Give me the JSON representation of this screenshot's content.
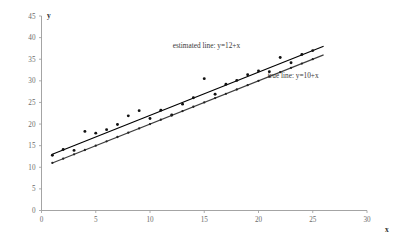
{
  "chart_data": {
    "type": "scatter",
    "title": "",
    "xlabel": "x",
    "ylabel": "y",
    "xlim": [
      0,
      30
    ],
    "ylim": [
      0,
      45
    ],
    "xticks": [
      0,
      5,
      10,
      15,
      20,
      25,
      30
    ],
    "yticks": [
      0,
      5,
      10,
      15,
      20,
      25,
      30,
      35,
      40,
      45
    ],
    "grid": false,
    "legend_position": "inline-annotations",
    "annotations": [
      {
        "name": "estimated-line-label",
        "text": "estimated line: y=12+x",
        "x": 15.2,
        "y": 37.6
      },
      {
        "name": "true-line-label",
        "text": "true line: y=10+x",
        "x": 23.2,
        "y": 30.6
      }
    ],
    "series": [
      {
        "name": "observed data",
        "type": "scatter",
        "marker": "filled-circle",
        "color": "#111111",
        "points": [
          {
            "x": 1,
            "y": 12.8
          },
          {
            "x": 2,
            "y": 14.1
          },
          {
            "x": 3,
            "y": 13.9
          },
          {
            "x": 4,
            "y": 18.3
          },
          {
            "x": 5,
            "y": 17.9
          },
          {
            "x": 6,
            "y": 18.7
          },
          {
            "x": 7,
            "y": 19.9
          },
          {
            "x": 8,
            "y": 21.9
          },
          {
            "x": 9,
            "y": 23.1
          },
          {
            "x": 10,
            "y": 21.3
          },
          {
            "x": 11,
            "y": 23.2
          },
          {
            "x": 12,
            "y": 22.1
          },
          {
            "x": 13,
            "y": 24.6
          },
          {
            "x": 14,
            "y": 26.1
          },
          {
            "x": 15,
            "y": 30.5
          },
          {
            "x": 16,
            "y": 26.9
          },
          {
            "x": 17,
            "y": 29.2
          },
          {
            "x": 18,
            "y": 30.1
          },
          {
            "x": 19,
            "y": 31.4
          },
          {
            "x": 20,
            "y": 32.3
          },
          {
            "x": 21,
            "y": 32.1
          },
          {
            "x": 22,
            "y": 35.4
          },
          {
            "x": 23,
            "y": 34.2
          },
          {
            "x": 24,
            "y": 36.1
          },
          {
            "x": 25,
            "y": 37.0
          }
        ]
      },
      {
        "name": "true line points",
        "type": "scatter",
        "marker": "small-filled-circle",
        "color": "#222222",
        "points": [
          {
            "x": 1,
            "y": 11.0
          },
          {
            "x": 2,
            "y": 12.0
          },
          {
            "x": 3,
            "y": 13.0
          },
          {
            "x": 4,
            "y": 14.0
          },
          {
            "x": 5,
            "y": 15.0
          },
          {
            "x": 6,
            "y": 16.0
          },
          {
            "x": 7,
            "y": 17.0
          },
          {
            "x": 8,
            "y": 18.0
          },
          {
            "x": 9,
            "y": 19.0
          },
          {
            "x": 10,
            "y": 20.0
          },
          {
            "x": 11,
            "y": 21.0
          },
          {
            "x": 12,
            "y": 22.0
          },
          {
            "x": 13,
            "y": 23.0
          },
          {
            "x": 14,
            "y": 24.0
          },
          {
            "x": 15,
            "y": 25.0
          },
          {
            "x": 16,
            "y": 26.0
          },
          {
            "x": 17,
            "y": 27.0
          },
          {
            "x": 18,
            "y": 28.0
          },
          {
            "x": 19,
            "y": 29.0
          },
          {
            "x": 20,
            "y": 30.0
          },
          {
            "x": 21,
            "y": 31.0
          },
          {
            "x": 22,
            "y": 32.0
          },
          {
            "x": 23,
            "y": 33.0
          },
          {
            "x": 24,
            "y": 34.0
          },
          {
            "x": 25,
            "y": 35.0
          }
        ]
      },
      {
        "name": "estimated line: y=12+x",
        "type": "line",
        "equation": "y=12+x",
        "intercept": 12,
        "slope": 1,
        "color": "#000000",
        "x_start": 1,
        "x_end": 26
      },
      {
        "name": "true line: y=10+x",
        "type": "line",
        "equation": "y=10+x",
        "intercept": 10,
        "slope": 1,
        "color": "#3d3d3d",
        "x_start": 1,
        "x_end": 26
      }
    ]
  },
  "axes": {
    "x_axis_name": "x",
    "y_axis_name": "y"
  }
}
